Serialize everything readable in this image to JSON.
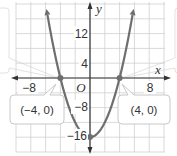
{
  "figure": {
    "equation_hint": "parabola through (-4, 0) and (4, 0) with vertex (0, -16)",
    "axis_labels": {
      "x": "x",
      "y": "y",
      "origin": "O"
    },
    "x_ticks": [
      "−8",
      "8"
    ],
    "y_ticks": [
      "12",
      "4",
      "−8",
      "−16"
    ],
    "callouts": [
      {
        "label": "(−4, 0)"
      },
      {
        "label": "(4, 0)"
      }
    ],
    "colors": {
      "curve": "#6e6e6e",
      "axis": "#333333",
      "grid": "#cfcfcf",
      "callout_border": "#c8c8c8",
      "point": "#6e6e6e"
    }
  },
  "chart_data": {
    "type": "line",
    "title": "",
    "xlabel": "x",
    "ylabel": "y",
    "function": "y = x^2 - 16",
    "x": [
      -5.9,
      -5,
      -4,
      -3,
      -2,
      -1,
      0,
      1,
      2,
      3,
      4,
      5,
      5.9
    ],
    "y": [
      18.8,
      9,
      0,
      -7,
      -12,
      -15,
      -16,
      -15,
      -12,
      -7,
      0,
      9,
      18.8
    ],
    "points": [
      {
        "x": -4,
        "y": 0,
        "label": "(−4, 0)"
      },
      {
        "x": 4,
        "y": 0,
        "label": "(4, 0)"
      },
      {
        "x": 0,
        "y": -16,
        "label": "−16"
      }
    ],
    "x_ticks": [
      -8,
      8
    ],
    "y_ticks": [
      12,
      4,
      -8,
      -16
    ],
    "xlim": [
      -10,
      10
    ],
    "ylim": [
      -20,
      20
    ],
    "grid": true,
    "grid_step": {
      "x": 2,
      "y": 4
    }
  }
}
